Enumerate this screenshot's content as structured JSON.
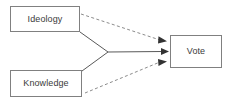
{
  "diagram": {
    "type": "path-diagram",
    "canvas": {
      "width": 235,
      "height": 105,
      "background": "#ffffff"
    },
    "style": {
      "box_border_color": "#808080",
      "box_fill_color": "#ffffff",
      "text_color": "#3b3b3b",
      "solid_edge_color": "#595959",
      "dashed_edge_color": "#8c8c8c"
    },
    "nodes": [
      {
        "id": "ideology",
        "label": "Ideology",
        "x": 10,
        "y": 6,
        "width": 70,
        "height": 26
      },
      {
        "id": "knowledge",
        "label": "Knowledge",
        "x": 10,
        "y": 70,
        "width": 72,
        "height": 27
      },
      {
        "id": "vote",
        "label": "Vote",
        "x": 170,
        "y": 35,
        "width": 52,
        "height": 33
      }
    ],
    "edges": [
      {
        "id": "ideology-dashed-to-vote",
        "from": "ideology",
        "to": "vote",
        "style": "dashed",
        "arrowhead": true
      },
      {
        "id": "ideology-solid-to-junction",
        "from": "ideology",
        "to": "junction",
        "style": "solid",
        "arrowhead": false
      },
      {
        "id": "knowledge-solid-to-junction",
        "from": "knowledge",
        "to": "junction",
        "style": "solid",
        "arrowhead": false
      },
      {
        "id": "junction-solid-to-vote",
        "from": "junction",
        "to": "vote",
        "style": "solid",
        "arrowhead": true
      },
      {
        "id": "knowledge-dashed-to-vote",
        "from": "knowledge",
        "to": "vote",
        "style": "dashed",
        "arrowhead": true
      }
    ]
  }
}
